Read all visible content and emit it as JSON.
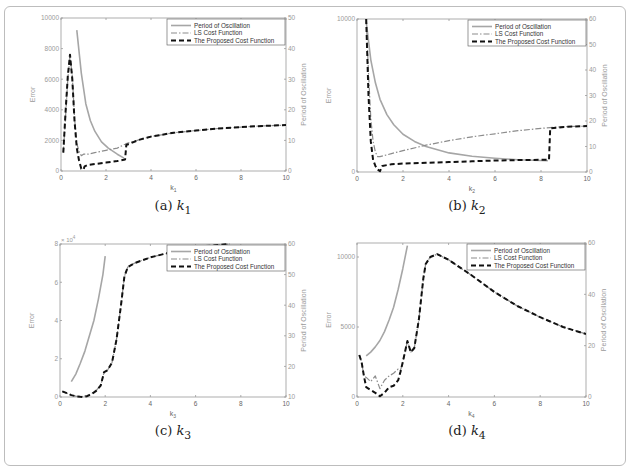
{
  "legend": {
    "period": "Period of Oscillation",
    "ls": "LS Cost Function",
    "proposed": "The Proposed Cost Function"
  },
  "colors": {
    "period": "#a6a6a6",
    "ls": "#8c8c8c",
    "proposed": "#111111",
    "axis": "#9a9a9a",
    "tick_text": "#9a9a9a",
    "frame": "#bdbdbd"
  },
  "chart_data": [
    {
      "id": "a",
      "type": "line",
      "caption_prefix": "(a)",
      "caption_var": "k",
      "caption_sub": "1",
      "xlabel": "k",
      "xlabel_sub": "1",
      "ylabel": "Error",
      "y2label": "Period of Oscillation",
      "xlim": [
        0,
        10
      ],
      "ylim": [
        0,
        10000
      ],
      "y2lim": [
        0,
        50
      ],
      "xticks": [
        0,
        2,
        4,
        6,
        8,
        10
      ],
      "yticks": [
        0,
        2000,
        4000,
        6000,
        8000,
        10000
      ],
      "y2ticks": [
        0,
        10,
        20,
        30,
        40,
        50
      ],
      "multiplier": "",
      "series": [
        {
          "name": "Period of Oscillation",
          "axis": "right",
          "x": [
            0.7,
            0.9,
            1.1,
            1.3,
            1.5,
            1.8,
            2.1,
            2.5,
            2.8
          ],
          "y": [
            46,
            32,
            22,
            16.5,
            13,
            9.5,
            7.5,
            5.5,
            4.2
          ]
        },
        {
          "name": "LS Cost Function",
          "axis": "left",
          "x": [
            0.1,
            0.2,
            0.3,
            0.4,
            0.5,
            0.6,
            0.7,
            0.8,
            0.9,
            1.0,
            1.2,
            1.5,
            2.0,
            2.5,
            2.85,
            2.9,
            3.5,
            4,
            5,
            6,
            7,
            8,
            9,
            10
          ],
          "y": [
            1200,
            3500,
            6000,
            7500,
            6200,
            3500,
            1800,
            1300,
            1000,
            1100,
            1100,
            1200,
            1350,
            1500,
            1750,
            1800,
            2050,
            2250,
            2500,
            2650,
            2780,
            2870,
            2950,
            3000
          ]
        },
        {
          "name": "The Proposed Cost Function",
          "axis": "left",
          "x": [
            0.1,
            0.2,
            0.3,
            0.4,
            0.5,
            0.6,
            0.7,
            0.8,
            0.9,
            1.0,
            1.05,
            1.2,
            1.5,
            2.0,
            2.5,
            2.85,
            2.9,
            3.5,
            4,
            5,
            6,
            7,
            8,
            9,
            10
          ],
          "y": [
            1200,
            3800,
            6200,
            7600,
            6000,
            3300,
            1500,
            700,
            150,
            100,
            300,
            400,
            450,
            550,
            650,
            750,
            1700,
            2050,
            2250,
            2500,
            2650,
            2780,
            2870,
            2950,
            3000
          ]
        }
      ]
    },
    {
      "id": "b",
      "type": "line",
      "caption_prefix": "(b)",
      "caption_var": "k",
      "caption_sub": "2",
      "xlabel": "k",
      "xlabel_sub": "2",
      "ylabel": "Error",
      "y2label": "Period of Oscillation",
      "xlim": [
        0,
        10
      ],
      "ylim": [
        0,
        10000
      ],
      "y2lim": [
        0,
        60
      ],
      "xticks": [
        0,
        2,
        4,
        6,
        8,
        10
      ],
      "yticks": [
        0,
        10000
      ],
      "y2ticks": [
        0,
        10,
        20,
        30,
        40,
        50,
        60
      ],
      "multiplier": "",
      "series": [
        {
          "name": "Period of Oscillation",
          "axis": "right",
          "x": [
            0.4,
            0.6,
            0.8,
            1.0,
            1.3,
            1.6,
            2.0,
            2.5,
            3,
            4,
            5,
            6,
            7,
            8,
            8.3
          ],
          "y": [
            59,
            44,
            35,
            28.5,
            22.5,
            18.5,
            14.8,
            12,
            10,
            7.5,
            6.2,
            5.4,
            4.8,
            4.5,
            4.4
          ]
        },
        {
          "name": "LS Cost Function",
          "axis": "left",
          "x": [
            0.4,
            0.5,
            0.6,
            0.7,
            0.8,
            0.9,
            1.0,
            1.5,
            2,
            3,
            4,
            5,
            6,
            7,
            8,
            8.4,
            9,
            10
          ],
          "y": [
            10000,
            6500,
            3500,
            2000,
            1300,
            1000,
            1000,
            1200,
            1400,
            1750,
            2050,
            2300,
            2500,
            2700,
            2850,
            2900,
            2970,
            3000
          ]
        },
        {
          "name": "The Proposed Cost Function",
          "axis": "left",
          "x": [
            0.4,
            0.5,
            0.6,
            0.7,
            0.8,
            0.9,
            1.0,
            1.1,
            1.5,
            2,
            3,
            4,
            5,
            6,
            7,
            8,
            8.35,
            8.4,
            9,
            10
          ],
          "y": [
            10000,
            5000,
            2000,
            800,
            400,
            150,
            50,
            400,
            500,
            550,
            600,
            650,
            700,
            750,
            780,
            800,
            800,
            2850,
            2950,
            3000
          ]
        }
      ]
    },
    {
      "id": "c",
      "type": "line",
      "caption_prefix": "(c)",
      "caption_var": "k",
      "caption_sub": "3",
      "xlabel": "k",
      "xlabel_sub": "3",
      "ylabel": "Error",
      "y2label": "Period of Oscillation",
      "xlim": [
        0,
        10
      ],
      "ylim": [
        0,
        80000
      ],
      "y2lim": [
        10,
        60
      ],
      "xticks": [
        0,
        2,
        4,
        6,
        8,
        10
      ],
      "yticks": [
        0,
        20000,
        40000,
        60000,
        80000
      ],
      "ytick_labels": [
        "0",
        "2",
        "4",
        "6",
        "8"
      ],
      "y2ticks": [
        10,
        20,
        30,
        40,
        50,
        60
      ],
      "multiplier": "× 10",
      "multiplier_exp": "4",
      "series": [
        {
          "name": "Period of Oscillation",
          "axis": "right",
          "x": [
            0.5,
            0.7,
            0.9,
            1.1,
            1.3,
            1.5,
            1.7,
            1.9,
            2.0
          ],
          "y": [
            15,
            17.5,
            21,
            25,
            30,
            35,
            42,
            50,
            56
          ]
        },
        {
          "name": "LS Cost Function",
          "axis": "left",
          "x": [
            0.1,
            0.3,
            0.5,
            0.7,
            0.9,
            1.0,
            1.2,
            1.4,
            1.6,
            1.8,
            1.95,
            2.1,
            2.3,
            2.5,
            2.7,
            2.85,
            3.0,
            3.3,
            4,
            5,
            6,
            7,
            7.5
          ],
          "y": [
            3000,
            2000,
            1000,
            400,
            200,
            300,
            800,
            1800,
            3500,
            6000,
            13000,
            14000,
            18000,
            30000,
            48000,
            63000,
            68000,
            70000,
            73000,
            76000,
            78500,
            79500,
            80000
          ]
        },
        {
          "name": "The Proposed Cost Function",
          "axis": "left",
          "x": [
            0.1,
            0.3,
            0.5,
            0.7,
            0.9,
            1.0,
            1.2,
            1.4,
            1.6,
            1.8,
            1.95,
            2.1,
            2.3,
            2.5,
            2.7,
            2.85,
            3.0,
            3.3,
            4,
            5,
            6,
            7,
            7.5
          ],
          "y": [
            3000,
            2000,
            1000,
            400,
            100,
            0,
            400,
            1500,
            3200,
            6000,
            13000,
            14000,
            18000,
            30000,
            48000,
            63000,
            68000,
            70000,
            73000,
            76000,
            78500,
            79500,
            80000
          ]
        }
      ]
    },
    {
      "id": "d",
      "type": "line",
      "caption_prefix": "(d)",
      "caption_var": "k",
      "caption_sub": "4",
      "xlabel": "k",
      "xlabel_sub": "4",
      "ylabel": "Error",
      "y2label": "Period of Oscillation",
      "xlim": [
        0,
        10
      ],
      "ylim": [
        0,
        11000
      ],
      "y2lim": [
        0,
        60
      ],
      "xticks": [
        0,
        2,
        4,
        6,
        8,
        10
      ],
      "yticks": [
        0,
        5000,
        10000
      ],
      "y2ticks": [
        0,
        20,
        40,
        60
      ],
      "multiplier": "",
      "series": [
        {
          "name": "Period of Oscillation",
          "axis": "right",
          "x": [
            0.4,
            0.6,
            0.8,
            1.0,
            1.2,
            1.4,
            1.6,
            1.8,
            2.0,
            2.2
          ],
          "y": [
            16,
            17.5,
            19.5,
            22,
            25.5,
            30,
            35,
            42,
            50,
            59
          ]
        },
        {
          "name": "LS Cost Function",
          "axis": "left",
          "x": [
            0.1,
            0.2,
            0.3,
            0.4,
            0.6,
            0.8,
            1.0,
            1.2,
            1.4,
            1.6,
            1.8,
            1.9,
            2.0,
            2.2,
            2.35,
            2.5,
            2.7,
            2.9,
            3.0,
            3.2,
            3.5,
            4,
            5,
            6,
            7,
            8,
            9,
            10
          ],
          "y": [
            3000,
            2500,
            1500,
            1400,
            1100,
            1500,
            600,
            1200,
            1500,
            1700,
            2000,
            1900,
            2500,
            4000,
            3200,
            3500,
            5500,
            8500,
            9500,
            10000,
            10200,
            9800,
            8700,
            7500,
            6500,
            5700,
            5000,
            4500
          ]
        },
        {
          "name": "The Proposed Cost Function",
          "axis": "left",
          "x": [
            0.1,
            0.2,
            0.3,
            0.4,
            0.6,
            0.8,
            1.0,
            1.2,
            1.4,
            1.6,
            1.8,
            1.9,
            2.0,
            2.2,
            2.35,
            2.5,
            2.7,
            2.9,
            3.0,
            3.2,
            3.5,
            4,
            5,
            6,
            7,
            8,
            9,
            10
          ],
          "y": [
            3000,
            2500,
            1500,
            700,
            500,
            300,
            50,
            300,
            700,
            800,
            1200,
            1800,
            2500,
            4000,
            3200,
            3500,
            5500,
            8500,
            9500,
            10000,
            10200,
            9800,
            8700,
            7500,
            6500,
            5700,
            5000,
            4500
          ]
        }
      ]
    }
  ]
}
